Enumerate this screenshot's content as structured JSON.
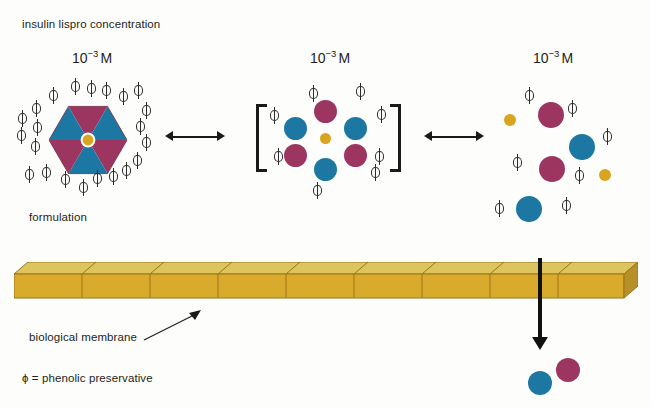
{
  "figure": {
    "title_label": "insulin lispro concentration",
    "formulation_label": "formulation",
    "membrane_label": "biological membrane",
    "legend_label": "ϕ = phenolic preservative",
    "phi_glyph": "ϕ"
  },
  "colors": {
    "insulin_blue": "#1d77a3",
    "insulin_magenta": "#9d3561",
    "zinc_gold": "#d9a520",
    "membrane_front": "#d8ab2c",
    "membrane_top": "#ddc45f",
    "membrane_cap": "#b8902a",
    "membrane_edge": "#9a7516",
    "arrow_black": "#1a1a1a",
    "background": "#fdfdfb"
  },
  "states": [
    {
      "id": "hexamer",
      "name": "hexamer",
      "concentration_mantissa": "10",
      "concentration_exponent": "−3",
      "concentration_unit": "M",
      "concentration_text": "10−3 M",
      "description": "insulin lispro hexamer with central zinc, surrounded by phenolic preservative",
      "phi_count": 22,
      "hexagon_wedges": [
        "magenta",
        "blue",
        "magenta",
        "blue",
        "magenta",
        "blue"
      ],
      "center_dot": "gold"
    },
    {
      "id": "bracketed-hexamer",
      "name": "dissociating hexamer in brackets",
      "concentration_mantissa": "10",
      "concentration_exponent": "−3",
      "concentration_unit": "M",
      "concentration_text": "10−3 M",
      "description": "six insulin monomers arranged about a zinc ion, enclosed in square brackets",
      "phi_count": 7,
      "monomers": [
        "magenta",
        "blue",
        "blue",
        "magenta",
        "magenta",
        "blue"
      ],
      "center_dot": "gold"
    },
    {
      "id": "monomers",
      "name": "free monomers",
      "concentration_mantissa": "10",
      "concentration_exponent": "−3",
      "concentration_unit": "M",
      "concentration_text": "10−3 M",
      "description": "dissociated insulin lispro monomers with free zinc and phenolic preservative",
      "phi_count": 6,
      "monomers": [
        "magenta",
        "magenta",
        "blue",
        "blue"
      ],
      "free_zinc": 2
    }
  ],
  "equilibria": [
    {
      "id": "eq-1",
      "symbol": "↔",
      "kind": "double-headed-arrow"
    },
    {
      "id": "eq-2",
      "symbol": "↔",
      "kind": "double-headed-arrow"
    }
  ],
  "transport": {
    "arrow_symbol": "↓",
    "kind": "down-arrow",
    "absorbed": [
      "blue",
      "magenta"
    ]
  },
  "membrane": {
    "segments": 8,
    "style": "3d-beam"
  }
}
